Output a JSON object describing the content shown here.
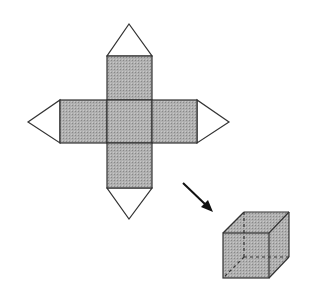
{
  "diagram": {
    "title": "",
    "colors": {
      "face_fill": "#a9a9a9",
      "tab_fill": "#ffffff",
      "stroke": "#333333",
      "background": "#ffffff"
    },
    "net": {
      "faces": [
        "top",
        "left",
        "center",
        "right",
        "bottom"
      ],
      "tabs": [
        "top",
        "left",
        "right",
        "bottom"
      ]
    },
    "arrow": {
      "direction": "down-right"
    },
    "cube": {
      "hidden_edges": "dashed"
    }
  }
}
